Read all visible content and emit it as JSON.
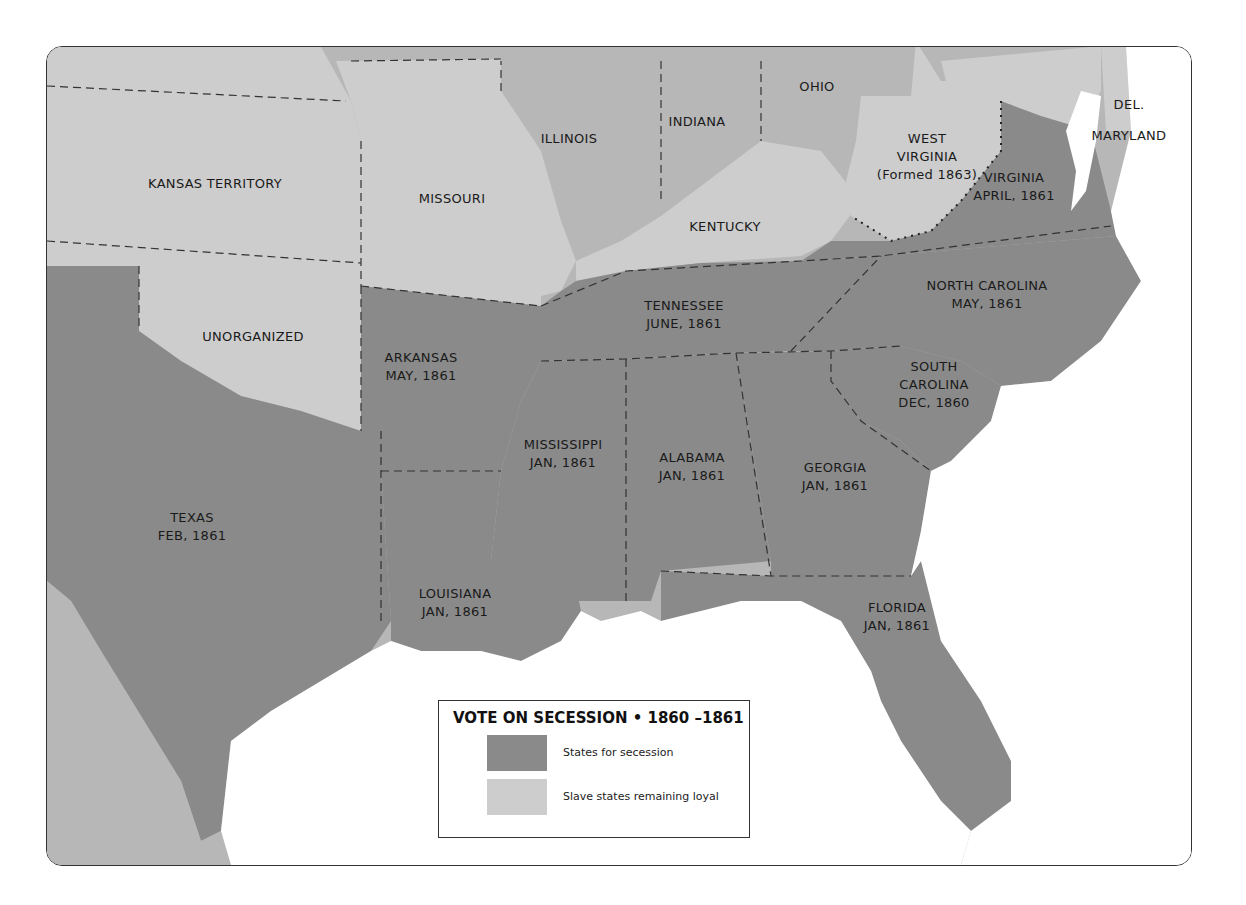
{
  "colors": {
    "secession": "#8a8a8a",
    "loyal": "#cdcdcd",
    "other": "#b7b7b7",
    "water": "#ffffff",
    "border": "#333333"
  },
  "legend": {
    "title": "VOTE ON SECESSION • 1860 –1861",
    "items": [
      {
        "label": "States for secession",
        "color": "#8a8a8a"
      },
      {
        "label": "Slave states remaining loyal",
        "color": "#cdcdcd"
      }
    ]
  },
  "regions": {
    "kansas": {
      "line1": "KANSAS TERRITORY"
    },
    "unorganized": {
      "line1": "UNORGANIZED"
    },
    "missouri": {
      "line1": "MISSOURI"
    },
    "illinois": {
      "line1": "ILLINOIS"
    },
    "indiana": {
      "line1": "INDIANA"
    },
    "ohio": {
      "line1": "OHIO"
    },
    "kentucky": {
      "line1": "KENTUCKY"
    },
    "west_virginia": {
      "line1": "WEST",
      "line2": "VIRGINIA",
      "line3": "(Formed 1863)"
    },
    "virginia": {
      "line1": "VIRGINIA",
      "line2": "APRIL, 1861"
    },
    "maryland": {
      "line1": "MARYLAND"
    },
    "delaware": {
      "line1": "DEL."
    },
    "north_carolina": {
      "line1": "NORTH CAROLINA",
      "line2": "MAY, 1861"
    },
    "tennessee": {
      "line1": "TENNESSEE",
      "line2": "JUNE, 1861"
    },
    "arkansas": {
      "line1": "ARKANSAS",
      "line2": "MAY, 1861"
    },
    "south_carolina": {
      "line1": "SOUTH",
      "line2": "CAROLINA",
      "line3": "DEC, 1860"
    },
    "mississippi": {
      "line1": "MISSISSIPPI",
      "line2": "JAN, 1861"
    },
    "alabama": {
      "line1": "ALABAMA",
      "line2": "JAN, 1861"
    },
    "georgia": {
      "line1": "GEORGIA",
      "line2": "JAN, 1861"
    },
    "texas": {
      "line1": "TEXAS",
      "line2": "FEB, 1861"
    },
    "louisiana": {
      "line1": "LOUISIANA",
      "line2": "JAN, 1861"
    },
    "florida": {
      "line1": "FLORIDA",
      "line2": "JAN, 1861"
    }
  }
}
